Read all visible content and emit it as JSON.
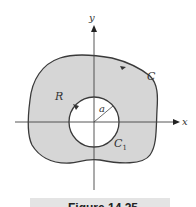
{
  "figure": {
    "caption": "Figure 14.25",
    "colors": {
      "region_fill": "#d6d6d6",
      "curve_stroke": "#3a3a3a",
      "axis_stroke": "#444444",
      "hole_fill": "#ffffff",
      "caption_bar": "#e4e4e4"
    },
    "axes": {
      "x_label": "x",
      "y_label": "y"
    },
    "labels": {
      "outer_curve": "C",
      "region": "R",
      "radius": "a",
      "inner_circle": "C",
      "inner_circle_subscript": "1"
    }
  }
}
